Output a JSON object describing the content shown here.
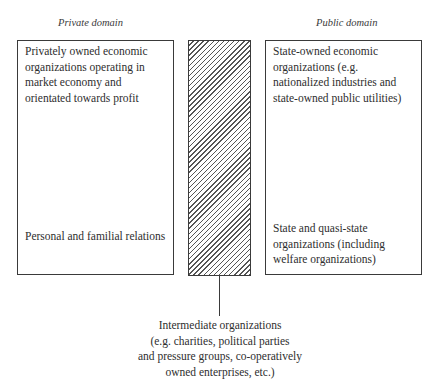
{
  "headings": {
    "private": "Private domain",
    "public": "Public domain"
  },
  "private_box": {
    "top_text": "Privately owned economic organizations operating in market economy and orientated towards profit",
    "bottom_text": "Personal and familial relations"
  },
  "public_box": {
    "top_text": "State-owned economic organizations (e.g. nationalized industries and state-owned public utilities)",
    "bottom_text": "State and quasi-state organizations (including welfare organizations)"
  },
  "intermediate": {
    "caption_lines": [
      "Intermediate organizations",
      "(e.g. charities, political parties",
      "and pressure groups, co-operatively",
      "owned enterprises, etc.)"
    ]
  },
  "colors": {
    "line": "#3a3a3a",
    "text": "#2e2e2e",
    "background": "#ffffff"
  }
}
